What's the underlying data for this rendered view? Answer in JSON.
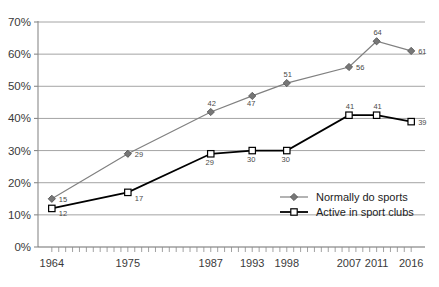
{
  "chart_data": {
    "type": "line",
    "title": "",
    "subtitle": "",
    "xlabel": "",
    "ylabel": "",
    "x": [
      1964,
      1975,
      1987,
      1993,
      1998,
      2007,
      2011,
      2016
    ],
    "categories": [
      "1964",
      "1975",
      "1987",
      "1993",
      "1998",
      "2007",
      "2011",
      "2016"
    ],
    "xlim": [
      1962,
      2018
    ],
    "ylim": [
      0,
      70
    ],
    "ytick_labels": [
      "0%",
      "10%",
      "20%",
      "30%",
      "40%",
      "50%",
      "60%",
      "70%"
    ],
    "ytick_values": [
      0,
      10,
      20,
      30,
      40,
      50,
      60,
      70
    ],
    "grid": "horizontal",
    "legend_position": "inside-lower-right",
    "series": [
      {
        "name": "Normally do sports",
        "marker": "diamond",
        "color": "#808080",
        "values": [
          15,
          29,
          42,
          47,
          51,
          56,
          64,
          61
        ],
        "labels": [
          "15",
          "29",
          "42",
          "47",
          "51",
          "56",
          "64",
          "61"
        ]
      },
      {
        "name": "Active in sport clubs",
        "marker": "square",
        "color": "#000000",
        "values": [
          12,
          17,
          29,
          30,
          30,
          41,
          41,
          39
        ],
        "labels": [
          "12",
          "17",
          "29",
          "30",
          "30",
          "41",
          "41",
          "39"
        ]
      }
    ]
  },
  "legend": {
    "items": [
      {
        "label": "Normally do sports",
        "marker": "diamond-icon",
        "color": "#808080"
      },
      {
        "label": "Active in sport clubs",
        "marker": "square-icon",
        "color": "#000000"
      }
    ]
  },
  "caption": {
    "text": ""
  }
}
